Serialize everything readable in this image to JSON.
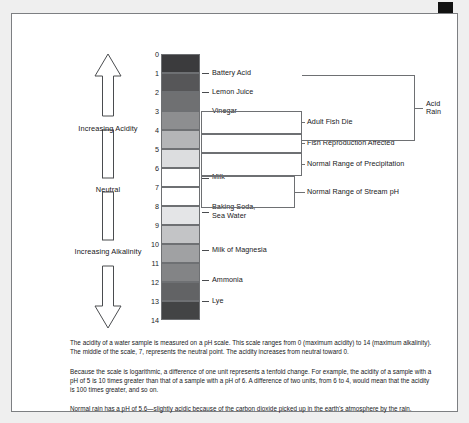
{
  "figure": {
    "title_hidden": "pH Scale",
    "axis": {
      "increasing_acidity": "Increasing\nAcidity",
      "neutral": "Neutral",
      "increasing_alkalinity": "Increasing\nAlkalinity"
    },
    "tick_labels": [
      "0",
      "1",
      "2",
      "3",
      "4",
      "5",
      "6",
      "7",
      "8",
      "9",
      "10",
      "11",
      "12",
      "13",
      "14"
    ],
    "bands": [
      {
        "ph_from": 0,
        "ph_to": 1,
        "color": "#3b3b3d"
      },
      {
        "ph_from": 1,
        "ph_to": 2,
        "color": "#565658"
      },
      {
        "ph_from": 2,
        "ph_to": 3,
        "color": "#6f7072"
      },
      {
        "ph_from": 3,
        "ph_to": 4,
        "color": "#8d8e90"
      },
      {
        "ph_from": 4,
        "ph_to": 5,
        "color": "#b4b5b7"
      },
      {
        "ph_from": 5,
        "ph_to": 6,
        "color": "#dcdddf"
      },
      {
        "ph_from": 6,
        "ph_to": 7,
        "color": "#ffffff"
      },
      {
        "ph_from": 7,
        "ph_to": 8,
        "color": "#ffffff"
      },
      {
        "ph_from": 8,
        "ph_to": 9,
        "color": "#e4e5e7"
      },
      {
        "ph_from": 9,
        "ph_to": 10,
        "color": "#c3c4c6"
      },
      {
        "ph_from": 10,
        "ph_to": 11,
        "color": "#a0a1a3"
      },
      {
        "ph_from": 11,
        "ph_to": 12,
        "color": "#838486"
      },
      {
        "ph_from": 12,
        "ph_to": 13,
        "color": "#626365"
      },
      {
        "ph_from": 13,
        "ph_to": 14,
        "color": "#434445"
      }
    ],
    "substances": [
      {
        "name": "Battery Acid",
        "ph": 1.0
      },
      {
        "name": "Lemon Juice",
        "ph": 2.0
      },
      {
        "name": "Vinegar",
        "ph": 3.0
      },
      {
        "name": "Milk",
        "ph": 6.5
      },
      {
        "name": "Baking Soda,\nSea Water",
        "ph": 8.3
      },
      {
        "name": "Milk of Magnesia",
        "ph": 10.3
      },
      {
        "name": "Ammonia",
        "ph": 11.9
      },
      {
        "name": "Lye",
        "ph": 13.0
      }
    ],
    "ranges": [
      {
        "label": "Adult Fish Die",
        "ph_from": 3.0,
        "ph_to": 4.2
      },
      {
        "label": "Fish Reproduction Affected",
        "ph_from": 4.2,
        "ph_to": 5.2
      },
      {
        "label": "Normal Range of Precipitation",
        "ph_from": 5.2,
        "ph_to": 6.4
      },
      {
        "label": "Normal Range of Stream pH",
        "ph_from": 6.4,
        "ph_to": 8.1
      }
    ],
    "bracket": {
      "label": "Acid\nRain",
      "ph_from": 1.1,
      "ph_to": 4.6
    }
  },
  "body": {
    "paragraphs": [
      "The acidity of a water sample is measured on a pH scale. This scale ranges from 0 (maximum acidity) to 14 (maximum alkalinity). The middle of the scale, 7, represents the neutral point. The acidity increases from neutral toward 0.",
      "Because the scale is logarithmic, a difference of one unit represents a tenfold change. For example, the acidity of a sample with a pH of 5 is 10 times greater than that of a sample with a pH of 6. A difference of two units, from 6 to 4, would mean that the acidity is 100 times greater, and so on.",
      "Normal rain has a pH of 5.6—slightly acidic because of the carbon dioxide picked up in the earth's atmosphere by the rain."
    ]
  }
}
